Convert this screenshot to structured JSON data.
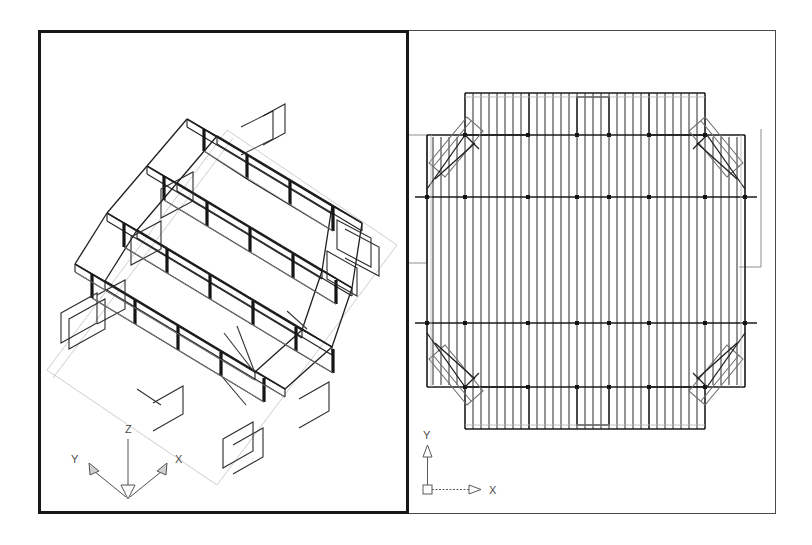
{
  "drawing": {
    "title": "CAD dual-viewport structural framing drawing",
    "background_color": "#ffffff",
    "line_color": "#1a1a1a",
    "faint_line_color": "#b0b0b0",
    "viewport_border_color": "#171717"
  },
  "viewports": [
    {
      "id": "model-3d",
      "name": "isometric-model-viewport",
      "view_type": "3D isometric wireframe",
      "border_weight": "thick",
      "ucs": {
        "type": "3d-isometric-axis-tripod",
        "axes": [
          {
            "label": "Z",
            "direction": "up"
          },
          {
            "label": "Y",
            "direction": "upper-left"
          },
          {
            "label": "X",
            "direction": "upper-right"
          }
        ],
        "arrowheads": "inward"
      },
      "content": {
        "description": "Steel framed multi-bay floor structure, joists and columns",
        "bay_rows": 4,
        "joists_per_bay": 26,
        "has_ground_plane_outline": true
      }
    },
    {
      "id": "plan-2d",
      "name": "plan-view-viewport",
      "view_type": "2D top / plan view",
      "border_weight": "thin",
      "ucs": {
        "type": "2d-wcs-icon",
        "axes": [
          {
            "label": "Y",
            "direction": "up"
          },
          {
            "label": "X",
            "direction": "right"
          }
        ],
        "origin_marker": "square"
      },
      "content": {
        "description": "Rectangular floor plan with joists, grid beams, corner braces and edge notches",
        "grid_beam_lines": 4,
        "corner_braces": 4,
        "edge_notches": 4,
        "joist_count": 46
      }
    }
  ]
}
